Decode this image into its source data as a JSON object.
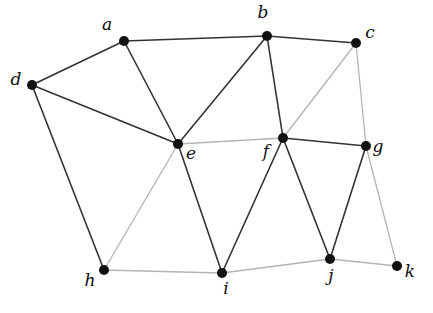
{
  "figure": {
    "kind": "undirected-graph-diagram",
    "background_color": "#ffffff",
    "width": 433,
    "height": 313,
    "vertex_color": "#111111",
    "vertex_radius": 5,
    "label_color": "#0d0d0d",
    "edge_colors": {
      "dark": "#333333",
      "light": "#b4b4b4"
    }
  },
  "graph_data": {
    "type": "graph",
    "directed": false,
    "vertex_count": 11,
    "edge_count": 22,
    "vertices": [
      {
        "id": "a",
        "label": "a",
        "x": 124,
        "y": 41,
        "label_x": 107,
        "label_y": 30,
        "degree": 3
      },
      {
        "id": "b",
        "label": "b",
        "x": 267,
        "y": 36,
        "label_x": 263,
        "label_y": 18,
        "degree": 4
      },
      {
        "id": "c",
        "label": "c",
        "x": 356,
        "y": 43,
        "label_x": 370,
        "label_y": 38,
        "degree": 3
      },
      {
        "id": "d",
        "label": "d",
        "x": 32,
        "y": 85,
        "label_x": 16,
        "label_y": 85,
        "degree": 3
      },
      {
        "id": "e",
        "label": "e",
        "x": 178,
        "y": 144,
        "label_x": 191,
        "label_y": 159,
        "degree": 6
      },
      {
        "id": "f",
        "label": "f",
        "x": 283,
        "y": 138,
        "label_x": 266,
        "label_y": 157,
        "degree": 6
      },
      {
        "id": "g",
        "label": "g",
        "x": 366,
        "y": 146,
        "label_x": 378,
        "label_y": 152,
        "degree": 4
      },
      {
        "id": "h",
        "label": "h",
        "x": 104,
        "y": 270,
        "label_x": 90,
        "label_y": 286,
        "degree": 3
      },
      {
        "id": "i",
        "label": "i",
        "x": 222,
        "y": 273,
        "label_x": 226,
        "label_y": 294,
        "degree": 4
      },
      {
        "id": "j",
        "label": "j",
        "x": 330,
        "y": 259,
        "label_x": 331,
        "label_y": 281,
        "degree": 4
      },
      {
        "id": "k",
        "label": "k",
        "x": 397,
        "y": 266,
        "label_x": 410,
        "label_y": 277,
        "degree": 2
      }
    ],
    "edges": [
      {
        "source": "a",
        "target": "b",
        "shade": "dark"
      },
      {
        "source": "a",
        "target": "d",
        "shade": "dark"
      },
      {
        "source": "a",
        "target": "e",
        "shade": "dark"
      },
      {
        "source": "b",
        "target": "c",
        "shade": "dark"
      },
      {
        "source": "b",
        "target": "e",
        "shade": "dark"
      },
      {
        "source": "b",
        "target": "f",
        "shade": "dark"
      },
      {
        "source": "c",
        "target": "f",
        "shade": "light"
      },
      {
        "source": "c",
        "target": "g",
        "shade": "light"
      },
      {
        "source": "d",
        "target": "e",
        "shade": "dark"
      },
      {
        "source": "d",
        "target": "h",
        "shade": "dark"
      },
      {
        "source": "e",
        "target": "f",
        "shade": "light"
      },
      {
        "source": "e",
        "target": "h",
        "shade": "light"
      },
      {
        "source": "e",
        "target": "i",
        "shade": "dark"
      },
      {
        "source": "f",
        "target": "g",
        "shade": "dark"
      },
      {
        "source": "f",
        "target": "i",
        "shade": "dark"
      },
      {
        "source": "f",
        "target": "j",
        "shade": "dark"
      },
      {
        "source": "g",
        "target": "j",
        "shade": "dark"
      },
      {
        "source": "g",
        "target": "k",
        "shade": "light"
      },
      {
        "source": "h",
        "target": "i",
        "shade": "light"
      },
      {
        "source": "i",
        "target": "j",
        "shade": "light"
      },
      {
        "source": "j",
        "target": "k",
        "shade": "light"
      }
    ]
  }
}
